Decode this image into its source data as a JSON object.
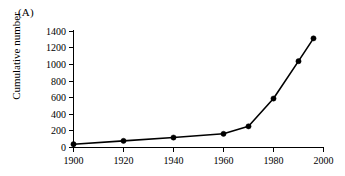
{
  "figure": {
    "panel_label": "(A)",
    "background_color": "#ffffff",
    "ink_color": "#000000"
  },
  "chart_data": {
    "type": "line",
    "title": "",
    "subtitle": "",
    "panel": "(A)",
    "xlabel": "",
    "ylabel": "Cumulative number",
    "x": [
      1900,
      1920,
      1940,
      1960,
      1970,
      1980,
      1990,
      1996
    ],
    "values": [
      40,
      80,
      120,
      165,
      255,
      590,
      1040,
      1315
    ],
    "series": [
      {
        "name": "Cumulative number",
        "x": [
          1900,
          1920,
          1940,
          1960,
          1970,
          1980,
          1990,
          1996
        ],
        "values": [
          40,
          80,
          120,
          165,
          255,
          590,
          1040,
          1315
        ],
        "marker": "filled-circle",
        "color": "#000000"
      }
    ],
    "xlim": [
      1900,
      2000
    ],
    "ylim": [
      0,
      1400
    ],
    "xticks": [
      1900,
      1920,
      1940,
      1960,
      1980,
      2000
    ],
    "xticklabels": [
      "1900",
      "1920",
      "1940",
      "1960",
      "1980",
      "2000"
    ],
    "yticks": [
      0,
      200,
      400,
      600,
      800,
      1000,
      1200,
      1400
    ],
    "yticklabels": [
      "0",
      "200",
      "400",
      "600",
      "800",
      "1000",
      "1200",
      "1400"
    ],
    "grid": false,
    "legend": false,
    "legend_position": "none",
    "annotations": []
  }
}
